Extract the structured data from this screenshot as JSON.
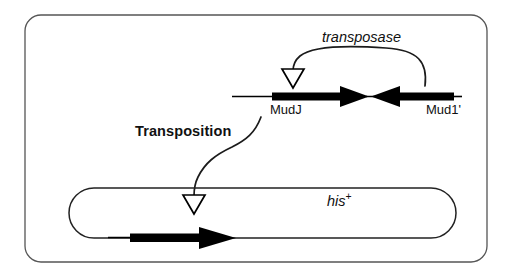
{
  "figure": {
    "kind": "genetics-transposition-diagram",
    "background_color": "#ffffff",
    "frame": {
      "name": "outer-panel-border",
      "stroke_color": "#444444"
    },
    "labels": {
      "transposase": "transposase",
      "mudj": "MudJ",
      "mud1": "Mud1'",
      "transposition": "Transposition",
      "his_plus_base": "his",
      "his_plus_sup": "+"
    },
    "elements": {
      "chromosome_line": "chromosome-line",
      "mudj_element": "mudj-element-arrow",
      "mud1_element": "mud1-element-arrow",
      "transposase_curve": "transposase-curved-arrow",
      "transposase_arrowhead": "transposase-hollow-arrowhead",
      "transposition_curve": "transposition-curved-arrow",
      "transposition_arrowhead": "transposition-hollow-arrowhead",
      "plasmid": "his-plus-plasmid-stadium",
      "plasmid_insert": "plasmid-inserted-element-arrow"
    },
    "colors": {
      "line": "#000000",
      "frame": "#444444",
      "text": "#111111"
    }
  }
}
